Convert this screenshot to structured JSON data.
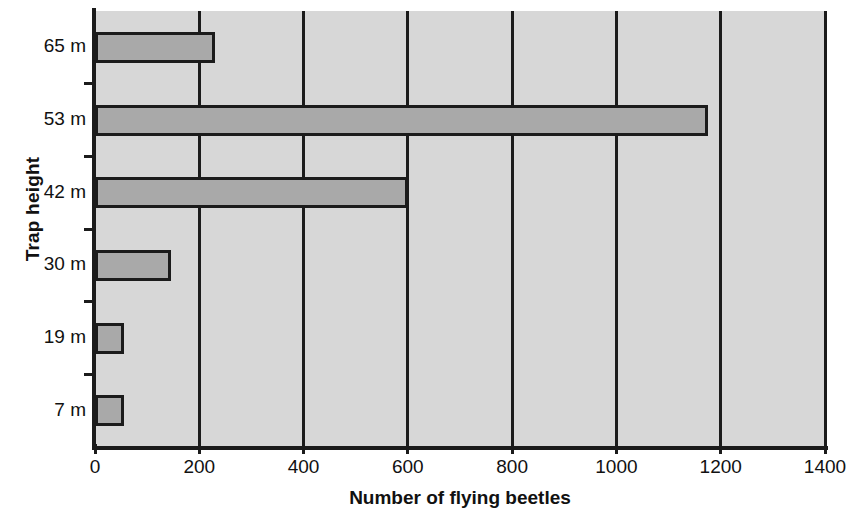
{
  "chart_data": {
    "type": "bar",
    "orientation": "horizontal",
    "title": "",
    "xlabel": "Number of flying beetles",
    "ylabel": "Trap height",
    "categories": [
      "7 m",
      "19 m",
      "30 m",
      "42 m",
      "53 m",
      "65 m"
    ],
    "values": [
      55,
      55,
      145,
      600,
      1175,
      230
    ],
    "xlim": [
      0,
      1400
    ],
    "xticks": [
      0,
      200,
      400,
      600,
      800,
      1000,
      1200,
      1400
    ],
    "xtick_labels": [
      "0",
      "200",
      "400",
      "600",
      "800",
      "1000",
      "1200",
      "1400"
    ],
    "grid": "vertical",
    "legend": "none",
    "bar_fill_color": "#a9a9a9",
    "bar_edge_color": "#1b1b1b",
    "plot_background_color": "#d7d7d7",
    "axis_color": "#1b1b1b",
    "figure_background_color": "#ffffff"
  },
  "axes": {
    "y_title": "Trap height",
    "x_title": "Number of flying beetles"
  }
}
